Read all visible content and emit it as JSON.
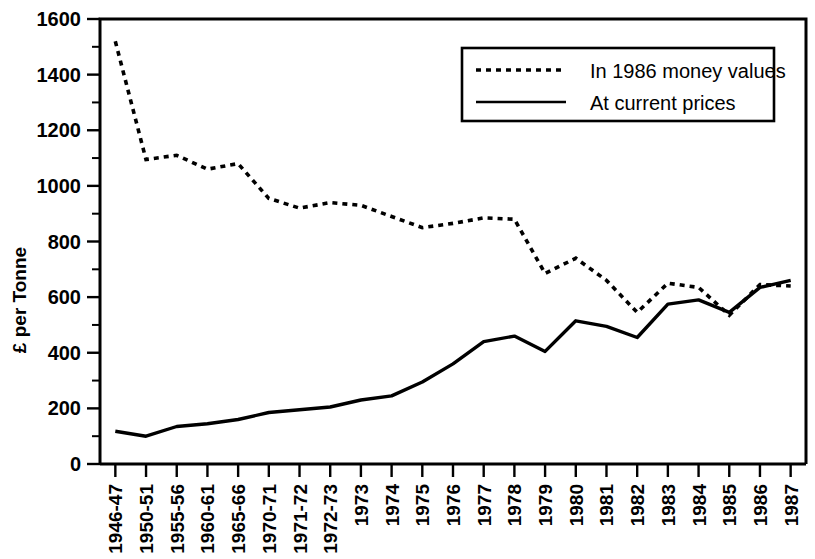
{
  "chart_data": {
    "type": "line",
    "title": "",
    "xlabel": "",
    "ylabel": "£ per Tonne",
    "ylim": [
      0,
      1600
    ],
    "ytick_step": 200,
    "yminor_step": 100,
    "grid": false,
    "legend_position": "top-right",
    "categories": [
      "1946-47",
      "1950-51",
      "1955-56",
      "1960-61",
      "1965-66",
      "1970-71",
      "1971-72",
      "1972-73",
      "1973",
      "1974",
      "1975",
      "1976",
      "1977",
      "1978",
      "1979",
      "1980",
      "1981",
      "1982",
      "1983",
      "1984",
      "1985",
      "1986",
      "1987"
    ],
    "ytick_labels": [
      "0",
      "200",
      "400",
      "600",
      "800",
      "1000",
      "1200",
      "1400",
      "1600"
    ],
    "series": [
      {
        "name": "In 1986 money values",
        "style": "dotted",
        "values": [
          1520,
          1095,
          1110,
          1060,
          1080,
          955,
          920,
          940,
          930,
          890,
          850,
          865,
          885,
          880,
          685,
          740,
          660,
          545,
          650,
          635,
          535,
          645,
          640
        ]
      },
      {
        "name": "At current prices",
        "style": "solid",
        "values": [
          118,
          100,
          135,
          145,
          160,
          185,
          195,
          205,
          230,
          245,
          295,
          360,
          440,
          460,
          405,
          515,
          495,
          455,
          575,
          590,
          545,
          635,
          660
        ]
      }
    ]
  },
  "legend": {
    "entries": [
      {
        "label": "In 1986 money values",
        "style": "dotted"
      },
      {
        "label": "At current prices",
        "style": "solid"
      }
    ]
  },
  "colors": {
    "ink": "#000000",
    "background": "#ffffff"
  }
}
